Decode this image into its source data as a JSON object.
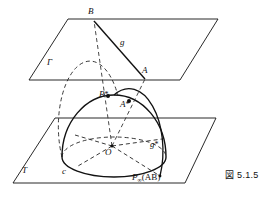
{
  "figure": {
    "caption": "図 5.1.5"
  },
  "labels": {
    "plane_upper": "Γ",
    "plane_lower": "T",
    "point_b": "B",
    "point_a": "A",
    "line_g": "g",
    "point_b_star": "B",
    "point_b_star_mark": "*",
    "point_a_star": "A",
    "point_a_star_mark": "*",
    "line_g_star": "g",
    "line_g_star_mark": "*",
    "center_o": "O",
    "circle_c": "c",
    "point_at_infinity": "P",
    "point_at_infinity_sub": "∞",
    "point_at_infinity_arg": "(AB)"
  },
  "colors": {
    "stroke": "#111111",
    "background": "#ffffff",
    "dashed": "#333333"
  }
}
